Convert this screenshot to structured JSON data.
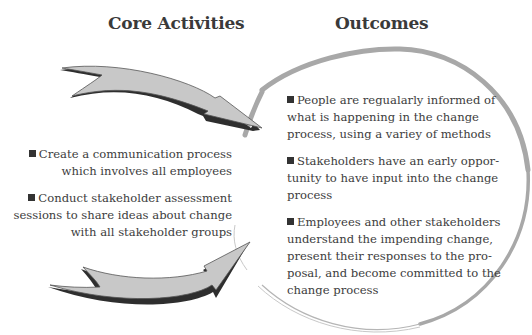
{
  "headings": {
    "core_activities": "Core Activities",
    "outcomes": "Outcomes"
  },
  "core_activities": [
    {
      "lines": [
        "Create a communication process",
        "which involves all employees"
      ]
    },
    {
      "lines": [
        "Conduct stakeholder assessment",
        "sessions to share ideas about change",
        "with all stakeholder groups"
      ]
    }
  ],
  "outcomes": [
    {
      "text": "People are regualarly informed of\nwhat is happening in the change\nprocess, using a variey of methods"
    },
    {
      "text": "Stakeholders have an early oppor-\ntunity to have input into the change\nprocess"
    },
    {
      "text": "Employees and other stakeholders\nunderstand the impending change,\npresent their responses to the pro-\nposal, and become committed to the\nchange process"
    }
  ],
  "graphics": {
    "top_arrow_icon": "curved-arrow-down-right",
    "bottom_arrow_icon": "curved-arrow-up-right",
    "circle": "outcomes-ellipse",
    "bullet_icon": "square-bullet"
  },
  "colors": {
    "arrow_fill": "#c8c8c8",
    "arrow_outline": "#2e2e2e",
    "circle_stroke": "#a8a8a8",
    "text": "#3c3c3c"
  }
}
